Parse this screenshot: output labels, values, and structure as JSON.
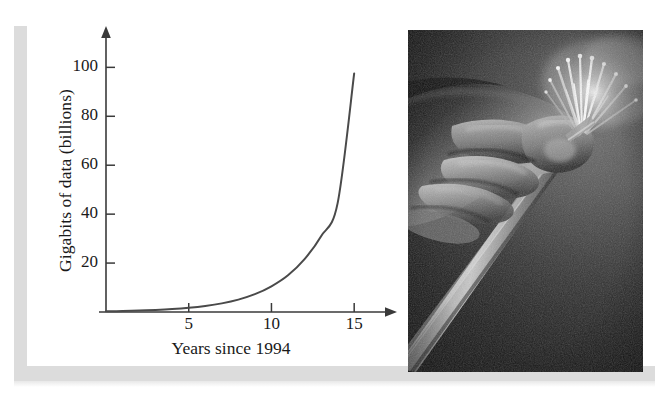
{
  "figure": {
    "title": "",
    "chart_label_y": "Gigabits of data (billions)",
    "chart_label_x": "Years since 1994"
  },
  "chart_data": {
    "type": "line",
    "title": "",
    "xlabel": "Years since 1994",
    "ylabel": "Gigabits of data (billions)",
    "xlim": [
      0,
      16.5
    ],
    "ylim": [
      0,
      112
    ],
    "xticks": [
      "5",
      "10",
      "15"
    ],
    "xtick_values": [
      5,
      10,
      15
    ],
    "yticks": [
      "20",
      "40",
      "60",
      "80",
      "100"
    ],
    "ytick_values": [
      20,
      40,
      60,
      80,
      100
    ],
    "grid": false,
    "legend": "none",
    "axis_arrows": true,
    "series": [
      {
        "name": "Gigabits of data",
        "x": [
          0,
          1,
          2,
          3,
          4,
          5,
          6,
          7,
          8,
          9,
          10,
          11,
          12,
          13,
          14,
          15
        ],
        "values": [
          0.28,
          0.4,
          0.58,
          0.83,
          1.19,
          1.71,
          2.46,
          3.53,
          5.07,
          7.28,
          10.5,
          15.0,
          21.6,
          31.0,
          44.5,
          97.5
        ]
      }
    ],
    "annotations": []
  },
  "photo": {
    "name": "fiber-optic-cable-photo",
    "description": "Black and white photograph of a hand holding a bundle of fiber optic strands",
    "alt": "hand holding fiber optic cable bundle"
  },
  "colors": {
    "curve": "#4a4a4a",
    "axis": "#3a3a3a",
    "text": "#1a1a1a",
    "frame_bar": "#dcdcdc",
    "page_background": "#ffffff",
    "photo_dark": "#2b2b2b"
  }
}
